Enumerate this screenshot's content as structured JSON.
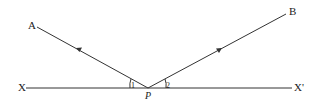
{
  "diagram": {
    "type": "reflection-ray-diagram",
    "labels": {
      "A": "A",
      "B": "B",
      "X": "X",
      "X_prime": "X'",
      "P": "P",
      "angle1": "1",
      "angle2": "2"
    },
    "colors": {
      "line": "#333333",
      "background": "#ffffff"
    }
  }
}
